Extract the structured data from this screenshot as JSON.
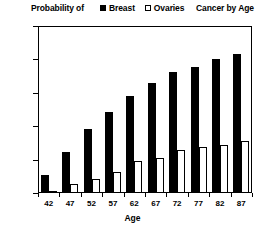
{
  "chart_data": {
    "type": "bar",
    "title_left": "Probability of",
    "title_right": "Cancer by Age",
    "xlabel": "Age",
    "ylabel": "",
    "categories": [
      "42",
      "47",
      "52",
      "57",
      "62",
      "67",
      "72",
      "77",
      "82",
      "87"
    ],
    "series": [
      {
        "name": "Breast",
        "swatch": "filled-square",
        "color": "#000000",
        "values": [
          0.054,
          0.122,
          0.192,
          0.243,
          0.29,
          0.33,
          0.362,
          0.377,
          0.4,
          0.415
        ]
      },
      {
        "name": "Ovaries",
        "swatch": "open-square",
        "color": "#ffffff",
        "values": [
          0.004,
          0.027,
          0.042,
          0.063,
          0.095,
          0.105,
          0.129,
          0.138,
          0.144,
          0.155
        ]
      }
    ],
    "ylim": [
      0,
      0.5
    ],
    "y_ticks": [
      "0",
      "0.1",
      "0.2",
      "0.3",
      "0.4",
      "0.5"
    ],
    "y_tick_values": [
      0,
      0.1,
      0.2,
      0.3,
      0.4,
      0.5
    ],
    "grid": false,
    "legend_position": "top-center"
  }
}
